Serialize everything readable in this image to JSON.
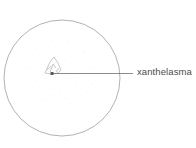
{
  "figure": {
    "type": "anatomical-line-illustration",
    "title": "xanthelasma",
    "background_color": "#ffffff",
    "canvas": {
      "width": 196,
      "height": 148
    }
  },
  "shapes": {
    "circle": {
      "name": "field-circle",
      "center_x": 62,
      "center_y": 78,
      "radius": 58,
      "stroke_color": "#a9a9a9",
      "stroke_width": 0.9,
      "fill": "none"
    },
    "stipple": {
      "name": "stipple-texture",
      "color": "#cfcfcf",
      "description": "faint scattered dots inside circle"
    },
    "lesion": {
      "name": "xanthelasma-lesion",
      "center_x": 54,
      "center_y": 66,
      "stroke_color": "#b4b4b4",
      "stroke_width": 0.7,
      "description": "small irregular angular peaked outline"
    },
    "anchor_dot": {
      "name": "leader-anchor-dot",
      "x": 52,
      "y": 73.5,
      "size": 3,
      "color": "#5a5a5a"
    },
    "leader_line": {
      "name": "leader-line",
      "x1": 52,
      "y1": 73.5,
      "x2": 133,
      "y2": 73.5,
      "stroke_color": "#6e6e6e",
      "stroke_width": 0.8
    }
  },
  "labels": {
    "xanthelasma": {
      "text": "xanthelasma",
      "color": "#4b4b4b",
      "font_size_px": 9.5,
      "x": 137,
      "y": 66
    }
  }
}
